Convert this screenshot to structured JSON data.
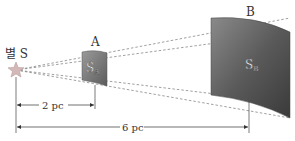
{
  "star": {
    "label": "별 S",
    "icon": "star-icon",
    "color": "#c8b0b0"
  },
  "surface_a": {
    "name": "A",
    "label_main": "S",
    "label_sub": "A",
    "color_top": "#8a8a8a",
    "color_bottom": "#5a5a5a"
  },
  "surface_b": {
    "name": "B",
    "label_main": "S",
    "label_sub": "B",
    "color_top": "#7a7a7a",
    "color_bottom": "#3a3a3a"
  },
  "dimensions": {
    "short": "2 pc",
    "long": "6 pc"
  }
}
